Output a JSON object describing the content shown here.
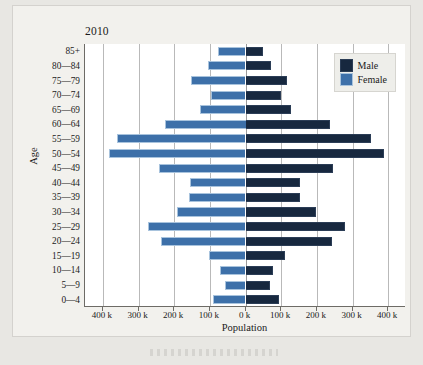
{
  "chart_data": {
    "type": "bar",
    "subtype": "population-pyramid",
    "title": "2010",
    "xlabel": "Population",
    "ylabel": "Age",
    "grid": true,
    "legend_position": "top-right",
    "orientation": "horizontal-diverging",
    "xlim": [
      -450000,
      450000
    ],
    "xtick_labels": [
      "400 k",
      "300 k",
      "200 k",
      "100 k",
      "0 k",
      "100 k",
      "200 k",
      "300 k",
      "400 k"
    ],
    "xtick_values": [
      -400000,
      -300000,
      -200000,
      -100000,
      0,
      100000,
      200000,
      300000,
      400000
    ],
    "axis_unit": "k",
    "categories": [
      "85+",
      "80—84",
      "75—79",
      "70—74",
      "65—69",
      "60—64",
      "55—59",
      "50—54",
      "45—49",
      "40—44",
      "35—39",
      "30—34",
      "25—29",
      "20—24",
      "15—19",
      "10—14",
      "5—9",
      "0—4"
    ],
    "series": [
      {
        "name": "Male",
        "color": "#17283f",
        "side": "right",
        "values": [
          48000,
          72000,
          117000,
          100000,
          128000,
          238000,
          352000,
          388000,
          245000,
          152000,
          152000,
          198000,
          278000,
          243000,
          110000,
          78000,
          68000,
          95000
        ]
      },
      {
        "name": "Female",
        "color": "#3d70a9",
        "side": "left",
        "values": [
          78000,
          105000,
          152000,
          98000,
          128000,
          225000,
          360000,
          382000,
          242000,
          155000,
          158000,
          192000,
          272000,
          238000,
          102000,
          72000,
          58000,
          92000
        ]
      }
    ]
  },
  "legend": {
    "items": [
      {
        "label": "Male",
        "swatch": "male"
      },
      {
        "label": "Female",
        "swatch": "female"
      }
    ]
  }
}
